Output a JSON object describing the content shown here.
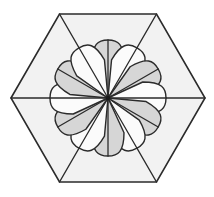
{
  "figure": {
    "background_color": "#ffffff",
    "canvas": {
      "width": 214,
      "height": 197
    },
    "center": {
      "x": 108,
      "y": 98
    },
    "stroke_color": "#2b2b2b",
    "outer_shape": {
      "name": "hexagon",
      "sides": 6,
      "orientation": "flat-top",
      "fill_color": "#f2f2f2",
      "stroke_color": "#2b2b2b",
      "stroke_width": 1.6,
      "circumradius": 97,
      "vertices": [
        {
          "label": "left",
          "x": 11,
          "y": 98
        },
        {
          "label": "top-left",
          "x": 59.5,
          "y": 14
        },
        {
          "label": "top-right",
          "x": 156.5,
          "y": 14
        },
        {
          "label": "right",
          "x": 205,
          "y": 98
        },
        {
          "label": "bottom-right",
          "x": 156.5,
          "y": 182
        },
        {
          "label": "bottom-left",
          "x": 59.5,
          "y": 182
        }
      ]
    },
    "spokes": {
      "count": 6,
      "description": "lines from hexagon center to each vertex",
      "stroke_color": "#2b2b2b",
      "stroke_width": 1.4
    },
    "rosette": {
      "name": "twelve-petal-rosette",
      "petal_count": 12,
      "petal_length": 58,
      "petal_half_width": 16,
      "angle_step_degrees": 30,
      "start_angle_degrees": -90,
      "shading": "alternating",
      "light_fill": "#fbfbfb",
      "dark_fill": "#d6d6d6",
      "stroke_color": "#2b2b2b",
      "stroke_width": 1.4,
      "petals": [
        {
          "index": 0,
          "angle": -90,
          "shade": "dark"
        },
        {
          "index": 1,
          "angle": -60,
          "shade": "light"
        },
        {
          "index": 2,
          "angle": -30,
          "shade": "dark"
        },
        {
          "index": 3,
          "angle": 0,
          "shade": "light"
        },
        {
          "index": 4,
          "angle": 30,
          "shade": "dark"
        },
        {
          "index": 5,
          "angle": 60,
          "shade": "light"
        },
        {
          "index": 6,
          "angle": 90,
          "shade": "dark"
        },
        {
          "index": 7,
          "angle": 120,
          "shade": "light"
        },
        {
          "index": 8,
          "angle": 150,
          "shade": "dark"
        },
        {
          "index": 9,
          "angle": 180,
          "shade": "light"
        },
        {
          "index": 10,
          "angle": 210,
          "shade": "dark"
        },
        {
          "index": 11,
          "angle": 240,
          "shade": "light"
        }
      ]
    },
    "center_marker": {
      "name": "center-point",
      "radius": 2.2,
      "color": "#1a1a1a"
    }
  }
}
